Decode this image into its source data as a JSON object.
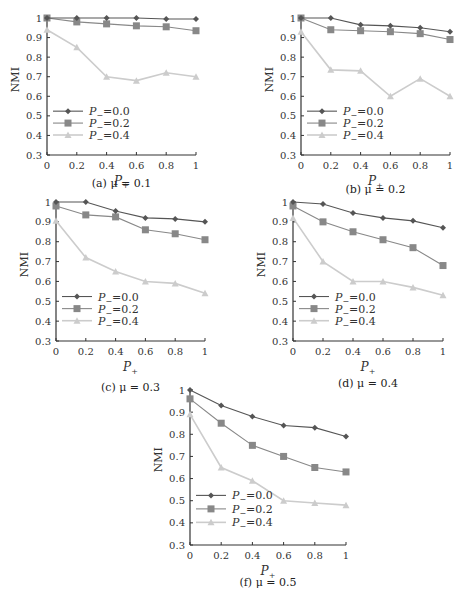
{
  "chart_data": [
    {
      "id": "a",
      "type": "line",
      "caption": "(a) μ = 0.1",
      "xlabel": "P+",
      "ylabel": "NMI",
      "x": [
        0,
        0.2,
        0.4,
        0.6,
        0.8,
        1
      ],
      "xticks": [
        "0",
        "0.2",
        "0.4",
        "0.6",
        "0.8",
        "1"
      ],
      "yticks": [
        "0.3",
        "0.4",
        "0.5",
        "0.6",
        "0.7",
        "0.8",
        "0.9",
        "1"
      ],
      "ylim": [
        0.3,
        1.0
      ],
      "xlim": [
        0,
        1
      ],
      "legend_position": "lower left",
      "series": [
        {
          "name": "P− = 0.0",
          "marker": "diamond",
          "color": "#555555",
          "values": [
            1.0,
            1.0,
            1.0,
            1.0,
            0.995,
            0.995
          ]
        },
        {
          "name": "P− = 0.2",
          "marker": "square",
          "color": "#888888",
          "values": [
            1.0,
            0.98,
            0.97,
            0.96,
            0.955,
            0.935
          ]
        },
        {
          "name": "P− = 0.4",
          "marker": "triangle",
          "color": "#cccccc",
          "values": [
            0.94,
            0.85,
            0.7,
            0.68,
            0.72,
            0.7
          ]
        }
      ]
    },
    {
      "id": "b",
      "type": "line",
      "caption": "(b) μ = 0.2",
      "xlabel": "P+",
      "ylabel": "NMI",
      "x": [
        0,
        0.2,
        0.4,
        0.6,
        0.8,
        1
      ],
      "xticks": [
        "0",
        "0.2",
        "0.4",
        "0.6",
        "0.8",
        "1"
      ],
      "yticks": [
        "0.3",
        "0.4",
        "0.5",
        "0.6",
        "0.7",
        "0.8",
        "0.9",
        "1"
      ],
      "ylim": [
        0.3,
        1.0
      ],
      "xlim": [
        0,
        1
      ],
      "legend_position": "lower left",
      "series": [
        {
          "name": "P− = 0.0",
          "marker": "diamond",
          "color": "#555555",
          "values": [
            1.0,
            1.0,
            0.965,
            0.96,
            0.95,
            0.93
          ]
        },
        {
          "name": "P− = 0.2",
          "marker": "square",
          "color": "#888888",
          "values": [
            1.0,
            0.94,
            0.935,
            0.93,
            0.92,
            0.89
          ]
        },
        {
          "name": "P− = 0.4",
          "marker": "triangle",
          "color": "#cccccc",
          "values": [
            0.93,
            0.735,
            0.73,
            0.6,
            0.69,
            0.6
          ]
        }
      ]
    },
    {
      "id": "c",
      "type": "line",
      "caption": "(c) μ = 0.3",
      "xlabel": "P+",
      "ylabel": "NMI",
      "x": [
        0,
        0.2,
        0.4,
        0.6,
        0.8,
        1
      ],
      "xticks": [
        "0",
        "0.2",
        "0.4",
        "0.6",
        "0.8",
        "1"
      ],
      "yticks": [
        "0.3",
        "0.4",
        "0.5",
        "0.6",
        "0.7",
        "0.8",
        "0.9",
        "1"
      ],
      "ylim": [
        0.3,
        1.0
      ],
      "xlim": [
        0,
        1
      ],
      "legend_position": "lower left",
      "series": [
        {
          "name": "P− = 0.0",
          "marker": "diamond",
          "color": "#555555",
          "values": [
            1.0,
            1.0,
            0.955,
            0.92,
            0.915,
            0.9
          ]
        },
        {
          "name": "P− = 0.2",
          "marker": "square",
          "color": "#888888",
          "values": [
            0.98,
            0.935,
            0.925,
            0.86,
            0.84,
            0.81
          ]
        },
        {
          "name": "P− = 0.4",
          "marker": "triangle",
          "color": "#cccccc",
          "values": [
            0.905,
            0.72,
            0.65,
            0.6,
            0.59,
            0.54
          ]
        }
      ]
    },
    {
      "id": "d",
      "type": "line",
      "caption": "(d) μ = 0.4",
      "xlabel": "P+",
      "ylabel": "NMI",
      "x": [
        0,
        0.2,
        0.4,
        0.6,
        0.8,
        1
      ],
      "xticks": [
        "0",
        "0.2",
        "0.4",
        "0.6",
        "0.8",
        "1"
      ],
      "yticks": [
        "0.3",
        "0.4",
        "0.5",
        "0.6",
        "0.7",
        "0.8",
        "0.9",
        "1"
      ],
      "ylim": [
        0.3,
        1.0
      ],
      "xlim": [
        0,
        1
      ],
      "legend_position": "lower left",
      "series": [
        {
          "name": "P− = 0.0",
          "marker": "diamond",
          "color": "#555555",
          "values": [
            1.0,
            0.99,
            0.945,
            0.92,
            0.905,
            0.87
          ]
        },
        {
          "name": "P− = 0.2",
          "marker": "square",
          "color": "#888888",
          "values": [
            0.98,
            0.9,
            0.85,
            0.81,
            0.77,
            0.68
          ]
        },
        {
          "name": "P− = 0.4",
          "marker": "triangle",
          "color": "#cccccc",
          "values": [
            0.92,
            0.7,
            0.6,
            0.6,
            0.57,
            0.53
          ]
        }
      ]
    },
    {
      "id": "f",
      "type": "line",
      "caption": "(f) μ = 0.5",
      "xlabel": "P+",
      "ylabel": "NMI",
      "x": [
        0,
        0.2,
        0.4,
        0.6,
        0.8,
        1
      ],
      "xticks": [
        "0",
        "0.2",
        "0.4",
        "0.6",
        "0.8",
        "1"
      ],
      "yticks": [
        "0.3",
        "0.4",
        "0.5",
        "0.6",
        "0.7",
        "0.8",
        "0.9",
        "1"
      ],
      "ylim": [
        0.3,
        1.0
      ],
      "xlim": [
        0,
        1
      ],
      "legend_position": "lower left",
      "series": [
        {
          "name": "P− = 0.0",
          "marker": "diamond",
          "color": "#555555",
          "values": [
            1.0,
            0.93,
            0.88,
            0.84,
            0.83,
            0.79
          ]
        },
        {
          "name": "P− = 0.2",
          "marker": "square",
          "color": "#888888",
          "values": [
            0.96,
            0.85,
            0.75,
            0.7,
            0.65,
            0.63
          ]
        },
        {
          "name": "P− = 0.4",
          "marker": "triangle",
          "color": "#cccccc",
          "values": [
            0.89,
            0.65,
            0.59,
            0.5,
            0.49,
            0.48
          ]
        }
      ]
    }
  ],
  "layout": {
    "panels": [
      {
        "left": 47,
        "top": 18,
        "width": 149,
        "height": 137,
        "caption_top": 177
      },
      {
        "left": 301,
        "top": 18,
        "width": 149,
        "height": 137,
        "caption_top": 183
      },
      {
        "left": 56,
        "top": 202,
        "width": 149,
        "height": 139,
        "caption_top": 381
      },
      {
        "left": 293,
        "top": 202,
        "width": 150,
        "height": 139,
        "caption_top": 377
      },
      {
        "left": 190,
        "top": 390,
        "width": 156,
        "height": 155,
        "caption_top": 576
      }
    ]
  }
}
